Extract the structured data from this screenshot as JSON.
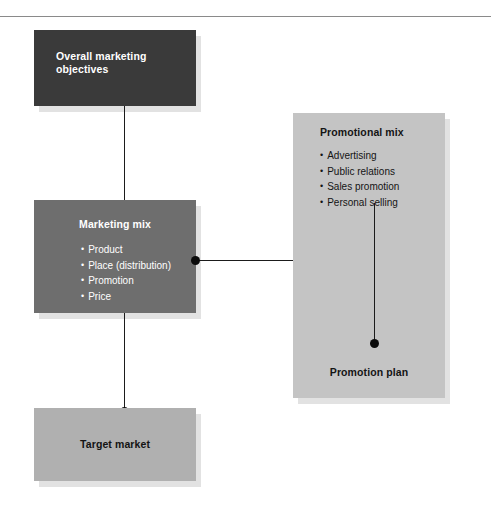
{
  "diagram": {
    "boxes": {
      "objectives": {
        "title": "Overall marketing objectives"
      },
      "marketing_mix": {
        "title": "Marketing mix",
        "bullets": [
          "Product",
          "Place (distribution)",
          "Promotion",
          "Price"
        ]
      },
      "target_market": {
        "title": "Target market"
      },
      "promotional_mix": {
        "title": "Promotional mix",
        "bullets": [
          "Advertising",
          "Public relations",
          "Sales promotion",
          "Personal selling"
        ],
        "plan_title": "Promotion plan"
      }
    },
    "colors": {
      "objectives_fill": "#3a3a3a",
      "marketing_mix_fill": "#6e6e6e",
      "target_market_fill": "#b0b0b0",
      "promotional_mix_fill": "#c4c4c4",
      "shadow": "#e2e2e2",
      "connector": "#1b1b1b",
      "light_text": "#ffffff",
      "dark_text": "#141414",
      "rule": "#8a8a8a",
      "page_background": "#ffffff"
    }
  }
}
